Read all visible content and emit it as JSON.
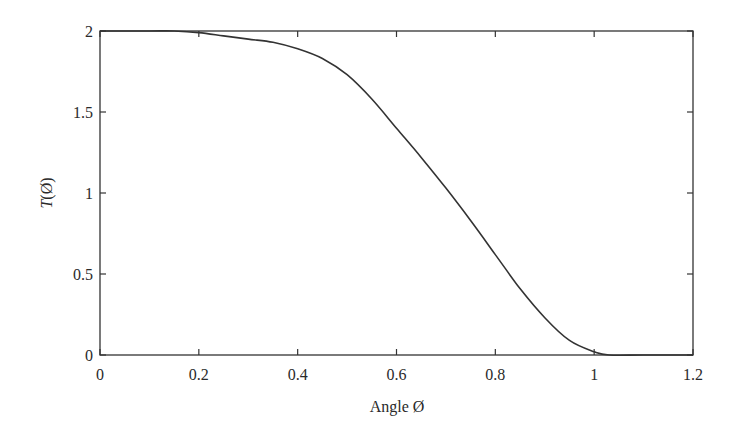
{
  "chart_data": {
    "type": "line",
    "title": "",
    "xlabel": "Angle Ø",
    "ylabel_italic": "T",
    "ylabel_rest": "(Ø)",
    "ylabel": "T(Ø)",
    "xlim": [
      0,
      1.2
    ],
    "ylim": [
      0,
      2
    ],
    "xticks": [
      0,
      0.2,
      0.4,
      0.6,
      0.8,
      1,
      1.2
    ],
    "xtick_labels": [
      "0",
      "0.2",
      "0.4",
      "0.6",
      "0.8",
      "1",
      "1.2"
    ],
    "yticks": [
      0,
      0.5,
      1,
      1.5,
      2
    ],
    "ytick_labels": [
      "0",
      "0.5",
      "1",
      "1.5",
      "2"
    ],
    "grid": false,
    "legend": null,
    "line_color": "#333333",
    "series": [
      {
        "name": "T(Ø)",
        "x": [
          0,
          0.1,
          0.15,
          0.2,
          0.25,
          0.3,
          0.35,
          0.4,
          0.45,
          0.5,
          0.55,
          0.6,
          0.65,
          0.7,
          0.75,
          0.8,
          0.85,
          0.9,
          0.95,
          1.0,
          1.03,
          1.1,
          1.2
        ],
        "y": [
          2.0,
          2.0,
          2.0,
          1.99,
          1.97,
          1.95,
          1.93,
          1.89,
          1.83,
          1.73,
          1.58,
          1.4,
          1.22,
          1.03,
          0.83,
          0.62,
          0.41,
          0.23,
          0.09,
          0.02,
          0.0,
          0.0,
          0.0
        ]
      }
    ]
  }
}
